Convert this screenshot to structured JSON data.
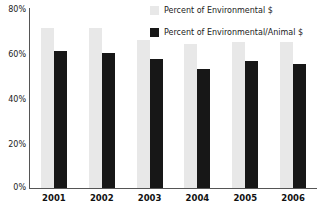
{
  "chart_data": {
    "type": "bar",
    "title": "",
    "xlabel": "",
    "ylabel": "",
    "categories": [
      "2001",
      "2002",
      "2003",
      "2004",
      "2005",
      "2006"
    ],
    "series": [
      {
        "name": "Percent of Environmental $",
        "color": "#e8e8e8",
        "values": [
          71,
          71,
          66,
          64,
          65,
          65
        ]
      },
      {
        "name": "Percent of Environmental/Animal $",
        "color": "#171717",
        "values": [
          61,
          60,
          57.5,
          53,
          56.5,
          55
        ]
      }
    ],
    "ylim": [
      0,
      80
    ],
    "y_ticks": [
      "0%",
      "20%",
      "40%",
      "60%",
      "80%"
    ],
    "y_tick_values": [
      0,
      20,
      40,
      60,
      80
    ],
    "grid": false,
    "legend_position": "top-right"
  },
  "legend": {
    "items": [
      {
        "label": "Percent of Environmental $",
        "color": "#e8e8e8"
      },
      {
        "label": "Percent of Environmental/Animal $",
        "color": "#171717"
      }
    ]
  },
  "axes": {
    "y_labels": [
      "80%",
      "60%",
      "40%",
      "20%",
      "0%"
    ],
    "x_labels": [
      "2001",
      "2002",
      "2003",
      "2004",
      "2005",
      "2006"
    ]
  }
}
